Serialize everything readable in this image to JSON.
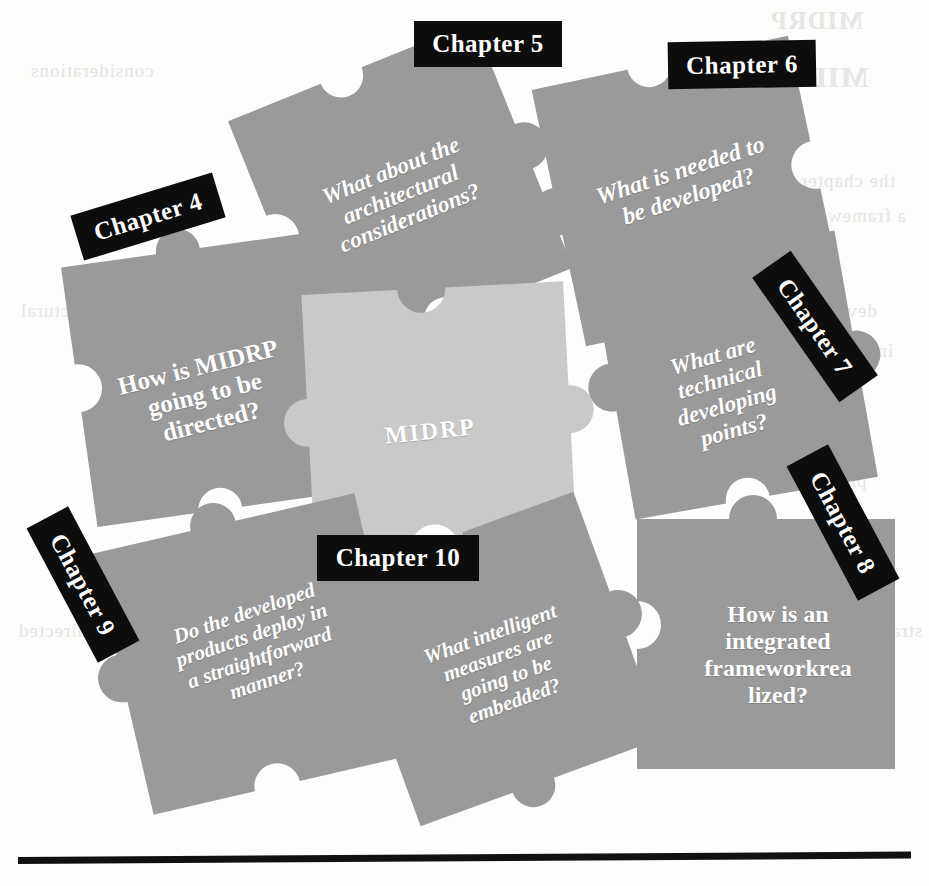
{
  "figure": {
    "center_piece": {
      "label": "MIDRP",
      "color": "#c9c9c9"
    },
    "piece_color": "#9a9a9a",
    "label_plate_color": "#0d0d0d",
    "label_text_color": "#ffffff",
    "page_background": "#fdfdfc",
    "rule_color": "#111111"
  },
  "pieces": [
    {
      "id": "chapter-4",
      "chapter_label": "Chapter 4",
      "question_lines": [
        "How is MIDRP",
        "going to be",
        "directed?"
      ],
      "color": "#9a9a9a"
    },
    {
      "id": "chapter-5",
      "chapter_label": "Chapter 5",
      "question_lines": [
        "What about the",
        "architectural",
        "considerations?"
      ],
      "color": "#9a9a9a"
    },
    {
      "id": "chapter-6",
      "chapter_label": "Chapter 6",
      "question_lines": [
        "What is needed to",
        "be developed?"
      ],
      "color": "#9a9a9a"
    },
    {
      "id": "chapter-7",
      "chapter_label": "Chapter 7",
      "question_lines": [
        "What are",
        "technical",
        "developing",
        "points?"
      ],
      "color": "#9a9a9a"
    },
    {
      "id": "chapter-8",
      "chapter_label": "Chapter 8",
      "question_lines": [
        "How is an",
        "integrated",
        "frameworkrea",
        "lized?"
      ],
      "color": "#9a9a9a"
    },
    {
      "id": "chapter-9",
      "chapter_label": "Chapter 9",
      "question_lines": [
        "Do the developed",
        "products deploy in",
        "a straightforward",
        "manner?"
      ],
      "color": "#9a9a9a"
    },
    {
      "id": "chapter-10",
      "chapter_label": "Chapter 10",
      "question_lines": [
        "What intelligent",
        "measures are",
        "going to be",
        "embedded?"
      ],
      "color": "#9a9a9a"
    }
  ],
  "center": {
    "id": "midrp",
    "label": "MIDRP"
  },
  "bleed_through": {
    "note": "faint mirrored ink showing through from reverse side of the scanned page",
    "lines": [
      "MIDRP",
      "MIDRP",
      "the chapter",
      "a framework of",
      "developed",
      "integration",
      "technical",
      "products",
      "deploy in",
      "embedded",
      "straightforward",
      "realized",
      "measures",
      "considerations",
      "architectural",
      "directed"
    ]
  }
}
